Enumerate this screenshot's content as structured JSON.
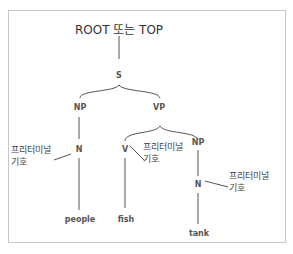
{
  "diagram": {
    "type": "parse-tree",
    "root_label": "ROOT 또는 TOP",
    "nodes": {
      "s": "S",
      "np_subject": "NP",
      "vp": "VP",
      "n_subject": "N",
      "v": "V",
      "np_object": "NP",
      "n_object": "N"
    },
    "words": {
      "people": "people",
      "fish": "fish",
      "tank": "tank"
    },
    "annotations": [
      {
        "line1": "프리터미널",
        "line2": "기호",
        "target": "N (people)"
      },
      {
        "line1": "프리터미널",
        "line2": "기호",
        "target": "V (fish)"
      },
      {
        "line1": "프리터미널",
        "line2": "기호",
        "target": "N (tank)"
      }
    ],
    "colors": {
      "line": "#555555",
      "frame": "#c8c8c8",
      "text": "#333333"
    }
  }
}
